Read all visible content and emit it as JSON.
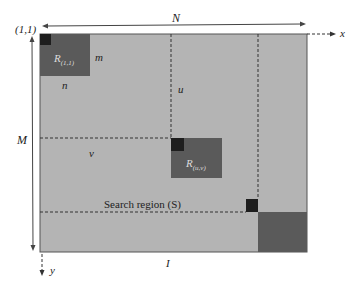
{
  "diagram": {
    "colors": {
      "background": "#ffffff",
      "image_region": "#b4b4b4",
      "block": "#5a5a5a",
      "pixel": "#1e1e1e",
      "lines": "#333333"
    },
    "labels": {
      "origin": "(1,1)",
      "width": "N",
      "height": "M",
      "x_axis": "x",
      "y_axis": "y",
      "block_first": "R",
      "block_first_sub": "(1,1)",
      "block_height": "m",
      "block_width": "n",
      "offset_u": "u",
      "offset_v": "v",
      "block_uv": "R",
      "block_uv_sub": "(u,v)",
      "search_region": "Search region (S)",
      "limit": "I"
    }
  }
}
